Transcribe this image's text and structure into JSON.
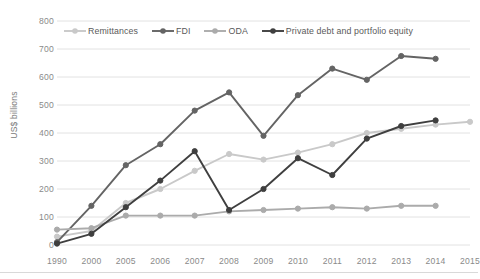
{
  "chart_data": {
    "type": "line",
    "title": "",
    "xlabel": "",
    "ylabel": "US$ billions",
    "ylim": [
      0,
      800
    ],
    "ytick_step": 100,
    "yticks": [
      0,
      100,
      200,
      300,
      400,
      500,
      600,
      700,
      800
    ],
    "grid": true,
    "legend_position": "top-inside",
    "categories": [
      "1990",
      "2000",
      "2005",
      "2006",
      "2007",
      "2008",
      "2009",
      "2010",
      "2011",
      "2012",
      "2013",
      "2014",
      "2015"
    ],
    "series": [
      {
        "name": "Remittances",
        "color": "#c9c9c9",
        "values": [
          30,
          50,
          150,
          200,
          265,
          325,
          305,
          330,
          360,
          400,
          415,
          430,
          440
        ]
      },
      {
        "name": "FDI",
        "color": "#646464",
        "values": [
          10,
          140,
          285,
          360,
          480,
          545,
          390,
          535,
          630,
          590,
          675,
          665,
          null
        ]
      },
      {
        "name": "ODA",
        "color": "#ababab",
        "values": [
          55,
          60,
          105,
          105,
          105,
          120,
          125,
          130,
          135,
          130,
          140,
          140,
          null
        ]
      },
      {
        "name": "Private debt and portfolio equity",
        "color": "#3f3f3f",
        "values": [
          5,
          40,
          135,
          230,
          335,
          125,
          200,
          310,
          250,
          380,
          425,
          445,
          null
        ]
      }
    ]
  },
  "axis": {
    "y_label": "US$ billions"
  },
  "legend": {
    "items": [
      {
        "label": "Remittances",
        "color": "#c9c9c9"
      },
      {
        "label": "FDI",
        "color": "#646464"
      },
      {
        "label": "ODA",
        "color": "#ababab"
      },
      {
        "label": "Private debt and portfolio equity",
        "color": "#3f3f3f"
      }
    ]
  }
}
